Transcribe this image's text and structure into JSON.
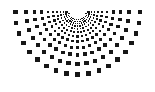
{
  "figure": {
    "width": 155,
    "height": 92,
    "background_color": "#ffffff",
    "dot_color": "#161616",
    "dot_shape": "square"
  },
  "chart_data": {
    "type": "scatter",
    "subtitle": "",
    "xlabel": "",
    "ylabel": "",
    "xlim": [
      0,
      155
    ],
    "ylim": [
      0,
      92
    ],
    "grid": false,
    "legend": "none",
    "annotations": [],
    "tick_labels": {
      "x": [],
      "y": []
    },
    "geometry": {
      "description": "Square dots placed on a polar grid of rays emanating from an apex near top-center; dot size grows with radius.",
      "origin_x": 77.5,
      "origin_y": 12.0,
      "ray_count": 19,
      "ring_count": 12,
      "angle_start_deg": 0,
      "angle_end_deg": 180,
      "angle_step_deg": 10,
      "radius_min": 8,
      "radius_max": 82,
      "radius_growth": 1.205,
      "dot_size_min": 0.9,
      "dot_size_max": 4.6,
      "dot_size_exponent": 0.92,
      "clip_to_canvas": true
    },
    "rays_deg": [
      0,
      10,
      20,
      30,
      40,
      50,
      60,
      70,
      80,
      90,
      100,
      110,
      120,
      130,
      140,
      150,
      160,
      170,
      180
    ],
    "ring_radii": [
      8.0,
      9.6,
      11.6,
      14.0,
      16.9,
      20.3,
      24.5,
      29.5,
      35.6,
      42.9,
      51.7,
      62.3
    ],
    "ring_dot_sizes": [
      0.9,
      1.05,
      1.25,
      1.45,
      1.7,
      2.0,
      2.35,
      2.7,
      3.1,
      3.6,
      4.1,
      4.6
    ],
    "series": [
      {
        "name": "dots",
        "color": "#161616",
        "point_count": 228
      }
    ]
  }
}
